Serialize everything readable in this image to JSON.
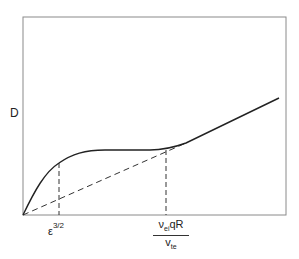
{
  "diagram": {
    "y_axis_label": "D",
    "x_ticks": [
      {
        "base": "ε",
        "superscript": "3/2"
      },
      {
        "numerator": {
          "symbol": "ν",
          "subscript": "ei",
          "rest": "qR"
        },
        "denominator": {
          "symbol": "v",
          "subscript": "te"
        }
      }
    ],
    "curves": [
      {
        "name": "diffusion-coefficient",
        "style": "solid",
        "description": "Rises from origin, plateaus between ε^3/2 and ν_ei qR/v_te, then increases linearly"
      },
      {
        "name": "asymptote",
        "style": "dashed",
        "description": "Straight line from origin merging with solid curve at high collisionality"
      }
    ],
    "colors": {
      "line": "#222222",
      "frame": "#888888",
      "background": "#ffffff"
    }
  }
}
